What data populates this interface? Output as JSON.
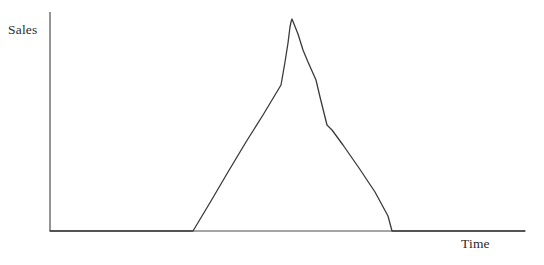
{
  "chart_data": {
    "type": "line",
    "title": "",
    "subtitle": "",
    "xlabel": "Time",
    "ylabel": "Sales",
    "legend": [],
    "annotations": [],
    "grid": false,
    "axes": {
      "style": "L-shaped open axes, no ticks, no tick labels",
      "x_axis_line": {
        "x_start_px": 50,
        "x_end_px": 525,
        "y_px": 231
      },
      "y_axis_line": {
        "x_px": 50,
        "y_start_px": 12,
        "y_end_px": 231
      },
      "xlim": [
        0,
        1
      ],
      "ylim": [
        0,
        1
      ],
      "x_ticks": [],
      "y_ticks": [],
      "x_tick_labels": [],
      "y_tick_labels": []
    },
    "series": [
      {
        "name": "Sales",
        "color": "#3a3a3a",
        "line_width": 1.3,
        "normalized_points": [
          {
            "x": 0.0,
            "y": 0.0
          },
          {
            "x": 0.302,
            "y": 0.0
          },
          {
            "x": 0.339,
            "y": 0.14
          },
          {
            "x": 0.376,
            "y": 0.28
          },
          {
            "x": 0.413,
            "y": 0.41
          },
          {
            "x": 0.45,
            "y": 0.54
          },
          {
            "x": 0.487,
            "y": 0.67
          },
          {
            "x": 0.509,
            "y": 0.77
          },
          {
            "x": 0.52,
            "y": 0.86
          },
          {
            "x": 0.528,
            "y": 0.94
          },
          {
            "x": 0.534,
            "y": 0.97
          },
          {
            "x": 0.54,
            "y": 1.0
          },
          {
            "x": 0.551,
            "y": 0.93
          },
          {
            "x": 0.562,
            "y": 0.85
          },
          {
            "x": 0.572,
            "y": 0.8
          },
          {
            "x": 0.582,
            "y": 0.76
          },
          {
            "x": 0.597,
            "y": 0.71
          },
          {
            "x": 0.613,
            "y": 0.63
          },
          {
            "x": 0.628,
            "y": 0.55
          },
          {
            "x": 0.641,
            "y": 0.49
          },
          {
            "x": 0.655,
            "y": 0.47
          },
          {
            "x": 0.676,
            "y": 0.4
          },
          {
            "x": 0.71,
            "y": 0.29
          },
          {
            "x": 0.744,
            "y": 0.18
          },
          {
            "x": 0.778,
            "y": 0.07
          },
          {
            "x": 0.8,
            "y": 0.0
          },
          {
            "x": 1.0,
            "y": 0.0
          }
        ],
        "pixel_points": [
          {
            "x": 50,
            "y": 231
          },
          {
            "x": 193,
            "y": 231
          },
          {
            "x": 211,
            "y": 201
          },
          {
            "x": 228,
            "y": 172
          },
          {
            "x": 246,
            "y": 142
          },
          {
            "x": 263,
            "y": 115
          },
          {
            "x": 281,
            "y": 85
          },
          {
            "x": 285,
            "y": 62
          },
          {
            "x": 288,
            "y": 43
          },
          {
            "x": 290,
            "y": 27
          },
          {
            "x": 291,
            "y": 22
          },
          {
            "x": 292,
            "y": 19
          },
          {
            "x": 298,
            "y": 34
          },
          {
            "x": 303,
            "y": 50
          },
          {
            "x": 308,
            "y": 62
          },
          {
            "x": 312,
            "y": 71
          },
          {
            "x": 316,
            "y": 80
          },
          {
            "x": 320,
            "y": 97
          },
          {
            "x": 324,
            "y": 113
          },
          {
            "x": 327,
            "y": 125
          },
          {
            "x": 332,
            "y": 130
          },
          {
            "x": 343,
            "y": 145
          },
          {
            "x": 359,
            "y": 168
          },
          {
            "x": 375,
            "y": 192
          },
          {
            "x": 388,
            "y": 216
          },
          {
            "x": 392,
            "y": 231
          },
          {
            "x": 525,
            "y": 231
          }
        ]
      }
    ],
    "colors": {
      "background": "#ffffff",
      "axis": "#4d4d4d",
      "curve": "#3a3a3a",
      "label_text": "#2b2b2b"
    }
  }
}
